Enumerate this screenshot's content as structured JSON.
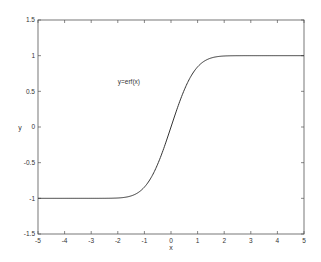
{
  "chart_data": {
    "type": "line",
    "title": "",
    "xlabel": "x",
    "ylabel": "y",
    "xlim": [
      -5,
      5
    ],
    "ylim": [
      -1.5,
      1.5
    ],
    "grid": false,
    "legend": null,
    "x_ticks": [
      -5,
      -4,
      -3,
      -2,
      -1,
      0,
      1,
      2,
      3,
      4,
      5
    ],
    "y_ticks": [
      -1.5,
      -1,
      -0.5,
      0,
      0.5,
      1,
      1.5
    ],
    "x_tick_labels": [
      "-5",
      "-4",
      "-3",
      "-2",
      "-1",
      "0",
      "1",
      "2",
      "3",
      "4",
      "5"
    ],
    "y_tick_labels": [
      "-1.5",
      "-1",
      "-0.5",
      "0",
      "0.5",
      "1",
      "1.5"
    ],
    "annotations": [
      {
        "text": "y=erf(x)",
        "x": -2.0,
        "y": 0.6
      }
    ],
    "series": [
      {
        "name": "y=erf(x)",
        "function": "erf",
        "x": [
          -5,
          -4,
          -3,
          -2.5,
          -2,
          -1.75,
          -1.5,
          -1.25,
          -1,
          -0.75,
          -0.5,
          -0.25,
          0,
          0.25,
          0.5,
          0.75,
          1,
          1.25,
          1.5,
          1.75,
          2,
          2.5,
          3,
          4,
          5
        ],
        "values": [
          -1.0,
          -1.0,
          -1.0,
          -0.9996,
          -0.9953,
          -0.9867,
          -0.9661,
          -0.9229,
          -0.8427,
          -0.7112,
          -0.5205,
          -0.2763,
          0.0,
          0.2763,
          0.5205,
          0.7112,
          0.8427,
          0.9229,
          0.9661,
          0.9867,
          0.9953,
          0.9996,
          1.0,
          1.0,
          1.0
        ]
      }
    ]
  },
  "colors": {
    "line": "#333333",
    "axes": "#555555",
    "background": "#ffffff"
  }
}
